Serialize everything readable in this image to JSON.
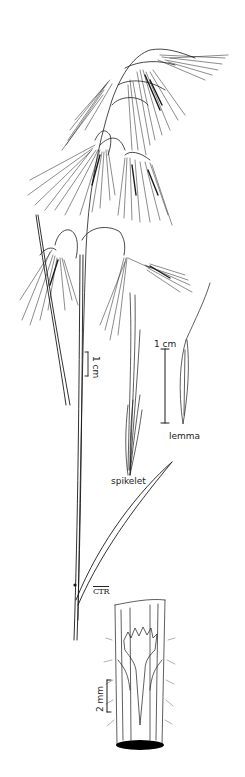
{
  "figure": {
    "background_color": "#ffffff",
    "line_color": "#1a1a1a"
  },
  "labels": {
    "scale_plant": "1 cm",
    "scale_spikelet_lemma": "1 cm",
    "lemma": "lemma",
    "spikelet": "spikelet",
    "scale_ligule": "2 mm",
    "signature": "CTR"
  },
  "parts": [
    {
      "name": "panicle",
      "description": "drooping panicle with long-awned spikelets"
    },
    {
      "name": "culm",
      "description": "tall slender stem with node and leaf"
    },
    {
      "name": "leaf-blade",
      "description": "narrow ascending leaf blade"
    },
    {
      "name": "spikelet",
      "description": "detail of awned spikelet"
    },
    {
      "name": "lemma",
      "description": "detail of lemma with awn"
    },
    {
      "name": "ligule",
      "description": "detail of sheath and toothed ligule, hairy"
    }
  ]
}
